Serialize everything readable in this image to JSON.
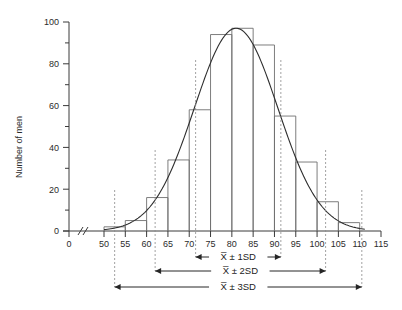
{
  "chart_data": {
    "type": "bar",
    "title": "",
    "xlabel": "",
    "ylabel": "Number of men",
    "xlim": [
      50,
      115
    ],
    "ylim": [
      0,
      100
    ],
    "grid": false,
    "legend": "none",
    "axis_break": "//",
    "bin_width": 5,
    "x_tick_labels": [
      "0",
      "50",
      "55",
      "60",
      "65",
      "70",
      "75",
      "80",
      "85",
      "90",
      "95",
      "100",
      "105",
      "110",
      "115"
    ],
    "y_tick_labels": [
      "0",
      "20",
      "40",
      "60",
      "80",
      "100"
    ],
    "y_minor_ticks": [
      10,
      30,
      50,
      70,
      90
    ],
    "bin_starts": [
      50,
      55,
      60,
      65,
      70,
      75,
      80,
      85,
      90,
      95,
      100,
      105
    ],
    "bin_ends": [
      55,
      60,
      65,
      70,
      75,
      80,
      85,
      90,
      95,
      100,
      105,
      110
    ],
    "categories": [
      "50-55",
      "55-60",
      "60-65",
      "65-70",
      "70-75",
      "75-80",
      "80-85",
      "85-90",
      "90-95",
      "95-100",
      "100-105",
      "105-110"
    ],
    "values": [
      2,
      5,
      16,
      34,
      58,
      94,
      97,
      89,
      55,
      33,
      14,
      4
    ],
    "curve": {
      "name": "normal distribution curve",
      "mean": 81,
      "sd": 9.8,
      "peak": 97
    },
    "annotations": [
      {
        "label": "X̅ ± 1SD",
        "from": 71.5,
        "to": 91.5
      },
      {
        "label": "X̅ ± 2SD",
        "from": 62.0,
        "to": 102.0
      },
      {
        "label": "X̅ ± 3SD",
        "from": 52.5,
        "to": 110.5
      }
    ]
  },
  "axes": {
    "y_title": "Number of men"
  }
}
